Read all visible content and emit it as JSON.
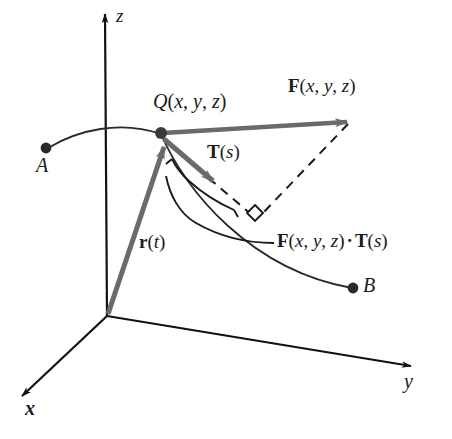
{
  "figure": {
    "background_color": "#ffffff",
    "vector_color": "#6a6a6a",
    "curve_color": "#2a2a2a",
    "axis_color": "#111111"
  },
  "axes": {
    "z": {
      "label": "z"
    },
    "y": {
      "label": "y"
    },
    "x": {
      "label": "x"
    }
  },
  "points": {
    "a": {
      "label": "A"
    },
    "b": {
      "label": "B"
    },
    "q": {
      "name": "Q",
      "open_paren": "(",
      "arg1": "x",
      "comma1": ", ",
      "arg2": "y",
      "comma2": ", ",
      "arg3": "z",
      "close_paren": ")"
    }
  },
  "vectors": {
    "field": {
      "name": "F",
      "open_paren": "(",
      "arg1": "x",
      "comma1": ", ",
      "arg2": "y",
      "comma2": ", ",
      "arg3": "z",
      "close_paren": ")"
    },
    "tangent": {
      "name": "T",
      "open_paren": "(",
      "arg1": "s",
      "close_paren": ")"
    },
    "position": {
      "name": "r",
      "open_paren": "(",
      "arg1": "t",
      "close_paren": ")"
    }
  },
  "annotations": {
    "dot_product": {
      "field_name": "F",
      "field_open": "(",
      "field_arg1": "x",
      "field_comma1": ", ",
      "field_arg2": "y",
      "field_comma2": ", ",
      "field_arg3": "z",
      "field_close": ")",
      "operator": "·",
      "tangent_name": "T",
      "tangent_open": "(",
      "tangent_arg": "s",
      "tangent_close": ")"
    }
  }
}
